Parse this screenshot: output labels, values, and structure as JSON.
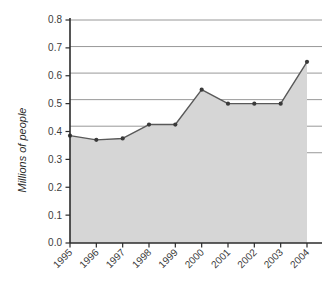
{
  "chart_data": {
    "type": "area",
    "title": "",
    "subtitle": "",
    "xlabel": "",
    "ylabel": "Millions of people",
    "categories": [
      "1995",
      "1996",
      "1997",
      "1998",
      "1999",
      "2000",
      "2001",
      "2002",
      "2003",
      "2004"
    ],
    "values": [
      0.385,
      0.37,
      0.375,
      0.425,
      0.425,
      0.55,
      0.5,
      0.5,
      0.5,
      0.65
    ],
    "series": [
      {
        "name": "Millions of people",
        "values": [
          0.385,
          0.37,
          0.375,
          0.425,
          0.425,
          0.55,
          0.5,
          0.5,
          0.5,
          0.65
        ]
      }
    ],
    "ylim": [
      0.0,
      0.8
    ],
    "ytick_labels": [
      "0.0",
      "0.1",
      "0.2",
      "0.3",
      "0.4",
      "0.5",
      "0.6",
      "0.7",
      "0.8"
    ],
    "ytick_values": [
      0.0,
      0.1,
      0.2,
      0.3,
      0.4,
      0.5,
      0.6,
      0.7,
      0.8
    ],
    "xtick_labels": [
      "1995",
      "1996",
      "1997",
      "1998",
      "1999",
      "2000",
      "2001",
      "2002",
      "2003",
      "2004"
    ],
    "grid": "horizontal",
    "gridline_count": 6,
    "legend": "none",
    "marker": "circle",
    "colors": {
      "fill": "#d6d6d6",
      "line": "#595959",
      "marker": "#3a3a3a",
      "gridline": "#8c8c8c",
      "axis": "#2b2b2b",
      "background": "#ffffff",
      "text": "#3c3c3c"
    }
  }
}
